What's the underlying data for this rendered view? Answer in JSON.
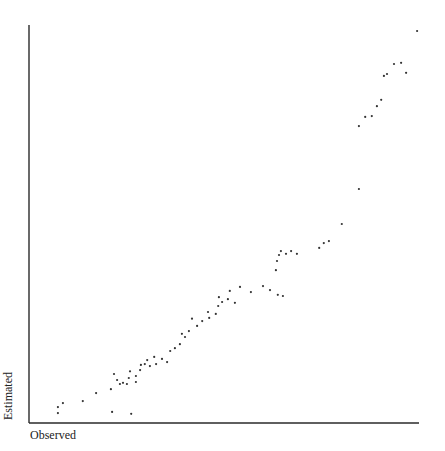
{
  "chart_data": {
    "type": "scatter",
    "title": "",
    "xlabel": "Observed",
    "ylabel": "Estimated",
    "xlim": [
      0,
      100
    ],
    "ylim": [
      0,
      100
    ],
    "grid": false,
    "legend": null,
    "ticks": "none shown",
    "series": [
      {
        "name": "Observed vs Estimated",
        "points": [
          [
            7.4,
            4.0
          ],
          [
            7.4,
            2.5
          ],
          [
            8.7,
            5.0
          ],
          [
            13.8,
            5.5
          ],
          [
            17.2,
            7.5
          ],
          [
            21.3,
            2.8
          ],
          [
            26.2,
            2.3
          ],
          [
            21.0,
            8.5
          ],
          [
            22.6,
            10.8
          ],
          [
            21.8,
            12.3
          ],
          [
            23.3,
            9.8
          ],
          [
            24.1,
            10.1
          ],
          [
            25.1,
            9.8
          ],
          [
            25.6,
            11.3
          ],
          [
            25.9,
            13.0
          ],
          [
            27.4,
            10.3
          ],
          [
            27.4,
            11.8
          ],
          [
            28.5,
            13.3
          ],
          [
            28.7,
            14.6
          ],
          [
            29.7,
            14.8
          ],
          [
            31.0,
            14.3
          ],
          [
            30.3,
            15.8
          ],
          [
            32.1,
            16.6
          ],
          [
            32.6,
            14.8
          ],
          [
            34.1,
            16.1
          ],
          [
            35.4,
            15.3
          ],
          [
            36.2,
            18.1
          ],
          [
            37.4,
            18.8
          ],
          [
            38.7,
            19.8
          ],
          [
            39.2,
            22.4
          ],
          [
            40.0,
            21.6
          ],
          [
            41.0,
            23.1
          ],
          [
            41.8,
            26.2
          ],
          [
            43.1,
            24.4
          ],
          [
            44.4,
            25.6
          ],
          [
            45.9,
            27.9
          ],
          [
            46.2,
            26.4
          ],
          [
            47.9,
            27.4
          ],
          [
            48.5,
            29.4
          ],
          [
            49.5,
            30.4
          ],
          [
            48.7,
            31.6
          ],
          [
            51.0,
            31.1
          ],
          [
            52.8,
            30.2
          ],
          [
            51.5,
            33.2
          ],
          [
            54.1,
            34.2
          ],
          [
            56.9,
            32.9
          ],
          [
            60.0,
            34.4
          ],
          [
            61.8,
            33.4
          ],
          [
            63.8,
            32.2
          ],
          [
            65.1,
            31.9
          ],
          [
            63.3,
            38.4
          ],
          [
            63.6,
            40.7
          ],
          [
            64.1,
            42.2
          ],
          [
            64.6,
            43.2
          ],
          [
            65.9,
            42.5
          ],
          [
            67.2,
            43.2
          ],
          [
            68.7,
            42.5
          ],
          [
            74.4,
            44.0
          ],
          [
            75.6,
            45.2
          ],
          [
            76.9,
            45.7
          ],
          [
            80.2,
            50.0
          ],
          [
            84.6,
            58.8
          ],
          [
            84.6,
            74.6
          ],
          [
            86.2,
            76.9
          ],
          [
            87.9,
            77.1
          ],
          [
            89.2,
            79.6
          ],
          [
            90.3,
            81.2
          ],
          [
            91.0,
            87.2
          ],
          [
            91.8,
            87.7
          ],
          [
            96.7,
            88.0
          ],
          [
            93.6,
            90.2
          ],
          [
            95.4,
            90.5
          ],
          [
            99.5,
            98.5
          ]
        ]
      }
    ]
  },
  "labels": {
    "x": "Observed",
    "y": "Estimated"
  }
}
